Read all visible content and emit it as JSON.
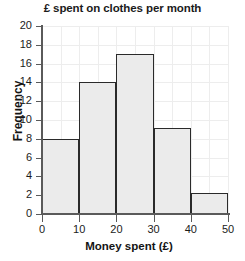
{
  "chart_data": {
    "type": "bar",
    "title": "£ spent on clothes per month",
    "xlabel": "Money spent (£)",
    "ylabel": "Frequency",
    "grid": true,
    "legend": "none",
    "xlim": [
      0,
      50
    ],
    "ylim": [
      0,
      20
    ],
    "xticks": [
      0,
      10,
      20,
      30,
      40,
      50
    ],
    "yticks": [
      0,
      2,
      4,
      6,
      8,
      10,
      12,
      14,
      16,
      18,
      20
    ],
    "bin_edges": [
      0,
      10,
      20,
      30,
      40,
      50
    ],
    "categories": [
      "0-10",
      "10-20",
      "20-30",
      "30-40",
      "40-50"
    ],
    "values": [
      8,
      14,
      17,
      9.2,
      2.2
    ],
    "bar_fill_color": "#ebebeb",
    "bar_edge_color": "#2a2a2a",
    "axis_color": "#5a5a5a",
    "grid_color": "#ededed",
    "background_color": "#ffffff"
  }
}
